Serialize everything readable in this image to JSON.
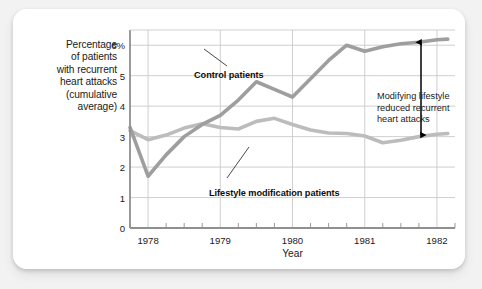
{
  "chart_data": {
    "type": "line",
    "title": "",
    "subtitle": "",
    "xlabel": "Year",
    "ylabel": "Percentage of patients with recurrent heart attacks (cumulative average)",
    "ylabel_lines": [
      "Percentage",
      "of patients",
      "with recurrent",
      "heart attacks",
      "(cumulative",
      "average)"
    ],
    "xlim": [
      1977.75,
      1982.25
    ],
    "ylim": [
      0,
      6.5
    ],
    "grid": true,
    "legend_position": "inline-callouts",
    "y_ticks": [
      {
        "value": 0,
        "label": "0"
      },
      {
        "value": 1,
        "label": "1"
      },
      {
        "value": 2,
        "label": "2"
      },
      {
        "value": 3,
        "label": "3"
      },
      {
        "value": 4,
        "label": "4"
      },
      {
        "value": 5,
        "label": "5"
      },
      {
        "value": 6,
        "label": "6%"
      }
    ],
    "x_ticks": [
      {
        "value": 1978,
        "label": "1978"
      },
      {
        "value": 1979,
        "label": "1979"
      },
      {
        "value": 1980,
        "label": "1980"
      },
      {
        "value": 1981,
        "label": "1981"
      },
      {
        "value": 1982,
        "label": "1982"
      }
    ],
    "x_minor_step": 0.25,
    "x": [
      1977.75,
      1978.0,
      1978.25,
      1978.5,
      1978.75,
      1979.0,
      1979.25,
      1979.5,
      1979.75,
      1980.0,
      1980.25,
      1980.5,
      1980.75,
      1981.0,
      1981.25,
      1981.5,
      1981.75,
      1982.0,
      1982.15
    ],
    "series": [
      {
        "name": "Control patients",
        "color": "#9e9e9e",
        "values": [
          3.3,
          1.7,
          2.4,
          3.0,
          3.4,
          3.7,
          4.2,
          4.8,
          4.55,
          4.3,
          4.9,
          5.5,
          6.0,
          5.8,
          5.95,
          6.05,
          6.1,
          6.18,
          6.2
        ]
      },
      {
        "name": "Lifestyle modification patients",
        "color": "#bcbcbc",
        "values": [
          3.2,
          2.9,
          3.05,
          3.28,
          3.42,
          3.3,
          3.25,
          3.5,
          3.6,
          3.4,
          3.22,
          3.12,
          3.1,
          3.02,
          2.8,
          2.88,
          3.0,
          3.08,
          3.1
        ]
      }
    ],
    "annotations": [
      {
        "name": "control-callout",
        "text": "Control patients"
      },
      {
        "name": "lifestyle-callout",
        "text": "Lifestyle modification patients"
      },
      {
        "name": "difference-annotation",
        "lines": [
          "Modifying lifestyle",
          "reduced recurrent",
          "heart attacks"
        ],
        "line1": "Modifying lifestyle",
        "line2": "reduced recurrent",
        "line3": "heart attacks",
        "arrow": "double-headed-vertical",
        "arrow_top_value": 6.1,
        "arrow_bottom_value": 3.05
      }
    ],
    "colors": {
      "control_line": "#9e9e9e",
      "lifestyle_line": "#bcbcbc",
      "grid": "#c9c9c9",
      "axis": "#8f8f8f",
      "text": "#1a1a1a",
      "arrow": "#000000",
      "card_background": "#ffffff",
      "page_background": "#f2f2f2"
    }
  }
}
